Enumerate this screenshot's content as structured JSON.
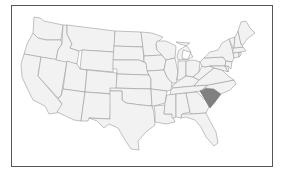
{
  "map": {
    "region": "United States (contiguous)",
    "highlighted_state": "South Carolina",
    "colors": {
      "default_fill": "#f2f2f2",
      "highlight_fill": "#808080",
      "border": "#9a9a9a",
      "frame": "#555555"
    }
  }
}
